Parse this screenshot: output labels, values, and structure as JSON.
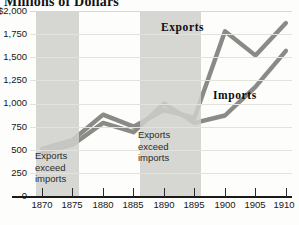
{
  "chart_title": "Millions of Dollars",
  "chart_data": {
    "type": "line",
    "title": "Millions of Dollars",
    "xlabel": "",
    "ylabel": "Millions of Dollars",
    "xlim": [
      1868,
      1911
    ],
    "ylim": [
      0,
      2000
    ],
    "grid": true,
    "legend_position": "inline-callouts",
    "x": [
      1870,
      1875,
      1880,
      1885,
      1890,
      1895,
      1900,
      1905,
      1910
    ],
    "xticks": [
      "1870",
      "1875",
      "1880",
      "1885",
      "1890",
      "1895",
      "1900",
      "1905",
      "1910"
    ],
    "yticks": [
      "0",
      "250",
      "500",
      "750",
      "1,000",
      "1,250",
      "1,500",
      "1,750",
      "$2,000"
    ],
    "ytick_values": [
      0,
      250,
      500,
      750,
      1000,
      1250,
      1500,
      1750,
      2000
    ],
    "series": [
      {
        "name": "Exports",
        "color": "#8a8a86",
        "values": [
          510,
          605,
          880,
          750,
          930,
          845,
          1780,
          1520,
          1870
        ]
      },
      {
        "name": "Imports",
        "color": "#8a8a86",
        "values": [
          465,
          555,
          790,
          690,
          1000,
          790,
          870,
          1180,
          1570
        ]
      }
    ],
    "annotations": [
      {
        "id": "band-1",
        "text": "Exports exceed imports",
        "lines": [
          "Exports",
          "exceed",
          "imports"
        ],
        "x_start": 1869,
        "x_end": 1876
      },
      {
        "id": "band-2",
        "text": "Exports exceed imports",
        "lines": [
          "Exports",
          "exceed",
          "imports"
        ],
        "x_start": 1886,
        "x_end": 1896
      }
    ],
    "shaded_band_color": "#cfcfcb"
  },
  "y_axis": {
    "labels": [
      {
        "text": "$2,000",
        "value": 2000
      },
      {
        "text": "1,750",
        "value": 1750
      },
      {
        "text": "1,500",
        "value": 1500
      },
      {
        "text": "1,250",
        "value": 1250
      },
      {
        "text": "1,000",
        "value": 1000
      },
      {
        "text": "750",
        "value": 750
      },
      {
        "text": "500",
        "value": 500
      },
      {
        "text": "250",
        "value": 250
      },
      {
        "text": "0",
        "value": 0
      }
    ]
  },
  "x_axis": {
    "labels": [
      {
        "text": "1870",
        "value": 1870
      },
      {
        "text": "1875",
        "value": 1875
      },
      {
        "text": "1880",
        "value": 1880
      },
      {
        "text": "1885",
        "value": 1885
      },
      {
        "text": "1890",
        "value": 1890
      },
      {
        "text": "1895",
        "value": 1895
      },
      {
        "text": "1900",
        "value": 1900
      },
      {
        "text": "1905",
        "value": 1905
      },
      {
        "text": "1910",
        "value": 1910
      }
    ]
  },
  "series_callouts": {
    "exports": "Exports",
    "imports": "Imports"
  },
  "band_notes": {
    "first": {
      "l1": "Exports",
      "l2": "exceed",
      "l3": "imports"
    },
    "second": {
      "l1": "Exports",
      "l2": "exceed",
      "l3": "imports"
    }
  }
}
